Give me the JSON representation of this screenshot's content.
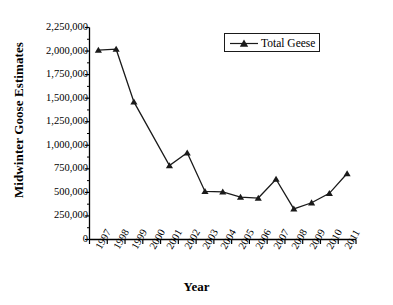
{
  "chart_data": {
    "type": "line",
    "title": "",
    "xlabel": "Year",
    "ylabel": "Midwinter Goose Estimates",
    "categories": [
      "1997",
      "1998",
      "1999",
      "2000",
      "2001",
      "2002",
      "2003",
      "2004",
      "2005",
      "2006",
      "2007",
      "2008",
      "2009",
      "2010",
      "2011"
    ],
    "x_tick_labels": [
      "1997",
      "1998",
      "1999",
      "2000",
      "2001",
      "2002",
      "2003",
      "2004",
      "2005",
      "2006",
      "2007",
      "2008",
      "2009",
      "2010",
      "2011"
    ],
    "y_tick_labels": [
      "0",
      "250,000",
      "500,000",
      "750,000",
      "1,000,000",
      "1,250,000",
      "1,500,000",
      "1,750,000",
      "2,000,000",
      "2,250,000"
    ],
    "y_tick_values": [
      0,
      250000,
      500000,
      750000,
      1000000,
      1250000,
      1500000,
      1750000,
      2000000,
      2250000
    ],
    "ylim": [
      0,
      2250000
    ],
    "grid": false,
    "legend_position": "top-right",
    "series": [
      {
        "name": "Total Geese",
        "marker": "triangle",
        "color": "#1a1a1a",
        "values": [
          2010000,
          2020000,
          1460000,
          null,
          785000,
          920000,
          510000,
          505000,
          450000,
          440000,
          640000,
          325000,
          390000,
          490000,
          700000
        ],
        "points": [
          {
            "x": "1997",
            "y": 2010000,
            "marker": true
          },
          {
            "x": "1998",
            "y": 2020000,
            "marker": true
          },
          {
            "x": "1999",
            "y": 1460000,
            "marker": true
          },
          {
            "x": "2001",
            "y": 785000,
            "marker": true
          },
          {
            "x": "2002",
            "y": 920000,
            "marker": true
          },
          {
            "x": "2003",
            "y": 510000,
            "marker": true
          },
          {
            "x": "2004",
            "y": 505000,
            "marker": true
          },
          {
            "x": "2005",
            "y": 450000,
            "marker": true
          },
          {
            "x": "2006",
            "y": 440000,
            "marker": true
          },
          {
            "x": "2007",
            "y": 640000,
            "marker": true
          },
          {
            "x": "2008",
            "y": 325000,
            "marker": true
          },
          {
            "x": "2009",
            "y": 390000,
            "marker": true
          },
          {
            "x": "2010",
            "y": 490000,
            "marker": true
          },
          {
            "x": "2011",
            "y": 700000,
            "marker": true
          }
        ]
      }
    ]
  },
  "legend": {
    "entries": [
      {
        "label": "Total Geese"
      }
    ]
  },
  "colors": {
    "line": "#1a1a1a",
    "marker": "#1a1a1a",
    "axis": "#000000",
    "background": "#ffffff"
  }
}
